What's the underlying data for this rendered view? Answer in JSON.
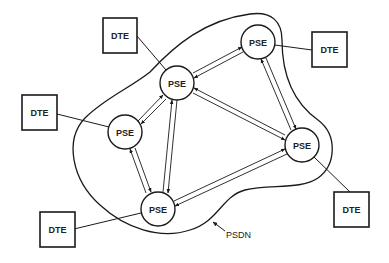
{
  "diagram": {
    "title": "",
    "network_label": "PSDN",
    "nodes": {
      "pse_top_right": {
        "label": "PSE",
        "type": "PSE",
        "cx": 258,
        "cy": 42
      },
      "pse_center_top": {
        "label": "PSE",
        "type": "PSE",
        "cx": 177,
        "cy": 83
      },
      "pse_left": {
        "label": "PSE",
        "type": "PSE",
        "cx": 125,
        "cy": 132
      },
      "pse_right": {
        "label": "PSE",
        "type": "PSE",
        "cx": 302,
        "cy": 145
      },
      "pse_bottom": {
        "label": "PSE",
        "type": "PSE",
        "cx": 158,
        "cy": 209
      },
      "dte_top_left": {
        "label": "DTE",
        "type": "DTE",
        "x": 103,
        "y": 18
      },
      "dte_left": {
        "label": "DTE",
        "type": "DTE",
        "x": 22,
        "y": 95
      },
      "dte_top_right": {
        "label": "DTE",
        "type": "DTE",
        "x": 312,
        "y": 32
      },
      "dte_bottom_left": {
        "label": "DTE",
        "type": "DTE",
        "x": 40,
        "y": 212
      },
      "dte_bottom_right": {
        "label": "DTE",
        "type": "DTE",
        "x": 334,
        "y": 192
      }
    },
    "pse_links": [
      [
        "pse_center_top",
        "pse_top_right"
      ],
      [
        "pse_center_top",
        "pse_left"
      ],
      [
        "pse_center_top",
        "pse_right"
      ],
      [
        "pse_center_top",
        "pse_bottom"
      ],
      [
        "pse_top_right",
        "pse_right"
      ],
      [
        "pse_left",
        "pse_bottom"
      ],
      [
        "pse_bottom",
        "pse_right"
      ]
    ],
    "dte_links": [
      [
        "dte_top_left",
        "pse_center_top"
      ],
      [
        "dte_left",
        "pse_left"
      ],
      [
        "dte_top_right",
        "pse_top_right"
      ],
      [
        "dte_bottom_left",
        "pse_bottom"
      ],
      [
        "dte_bottom_right",
        "pse_right"
      ]
    ],
    "colors": {
      "stroke": "#1a1a1a",
      "background": "#ffffff"
    }
  }
}
